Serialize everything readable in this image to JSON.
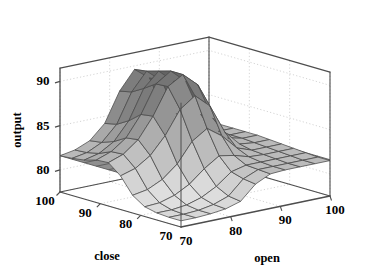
{
  "figure": {
    "type": "surface-plot-3d",
    "background_color": "#ffffff",
    "line_color": "#4d4d4d",
    "grid_color": "#c9c9c9"
  },
  "axes": {
    "x": {
      "name": "open",
      "title": "open",
      "ticks": [
        "70",
        "80",
        "90",
        "100"
      ],
      "tick_values": [
        70,
        80,
        90,
        100
      ],
      "range": [
        70,
        100
      ]
    },
    "y": {
      "name": "close",
      "title": "close",
      "ticks": [
        "100",
        "90",
        "80",
        "70"
      ],
      "tick_values": [
        100,
        90,
        80,
        70
      ],
      "range": [
        70,
        100
      ]
    },
    "z": {
      "name": "output",
      "title": "output",
      "ticks": [
        "80",
        "85",
        "90"
      ],
      "tick_values": [
        80,
        85,
        90
      ],
      "range": [
        77.5,
        91.5
      ]
    }
  },
  "chart_data": {
    "type": "surface",
    "title": "",
    "xlabel": "open",
    "ylabel": "close",
    "zlabel": "output",
    "xlim": [
      70,
      100
    ],
    "ylim": [
      70,
      100
    ],
    "zlim": [
      77.5,
      91.5
    ],
    "grid": true,
    "legend": "none",
    "colormap": "gray",
    "x": [
      70,
      73,
      76,
      79,
      82,
      85,
      88,
      91,
      94,
      97,
      100
    ],
    "y": [
      70,
      73,
      76,
      79,
      82,
      85,
      88,
      91,
      94,
      97,
      100
    ],
    "z_note": "rows correspond to y (close) from 70 to 100, columns to x (open) from 70 to 100",
    "z": [
      [
        78.2,
        78.2,
        78.3,
        78.5,
        79.0,
        80.6,
        81.4,
        81.5,
        81.5,
        81.5,
        81.5
      ],
      [
        78.2,
        78.2,
        78.3,
        78.6,
        79.2,
        80.8,
        81.5,
        81.5,
        81.5,
        81.5,
        81.5
      ],
      [
        78.3,
        78.3,
        78.5,
        79.0,
        79.9,
        81.2,
        81.6,
        81.6,
        81.6,
        81.6,
        81.6
      ],
      [
        78.6,
        78.7,
        79.2,
        80.1,
        81.5,
        82.6,
        82.3,
        81.8,
        81.7,
        81.7,
        81.7
      ],
      [
        79.5,
        79.8,
        80.6,
        82.0,
        84.2,
        85.3,
        84.1,
        82.4,
        81.8,
        81.8,
        81.8
      ],
      [
        81.3,
        81.8,
        82.9,
        84.8,
        87.4,
        88.6,
        87.1,
        83.8,
        82.1,
        81.9,
        81.9
      ],
      [
        82.4,
        83.0,
        84.3,
        86.6,
        89.6,
        90.6,
        89.1,
        85.0,
        82.4,
        82.0,
        82.0
      ],
      [
        82.3,
        82.9,
        84.1,
        86.4,
        89.5,
        90.6,
        89.1,
        85.0,
        82.4,
        82.0,
        82.0
      ],
      [
        81.9,
        82.3,
        83.3,
        85.3,
        88.6,
        90.2,
        88.7,
        84.6,
        82.3,
        82.0,
        82.0
      ],
      [
        81.7,
        82.0,
        82.8,
        84.5,
        87.8,
        89.8,
        88.4,
        84.3,
        82.2,
        82.0,
        82.0
      ],
      [
        81.6,
        81.9,
        82.6,
        84.2,
        87.5,
        89.6,
        88.3,
        84.2,
        82.2,
        82.0,
        82.0
      ]
    ],
    "reference_plane": {
      "present": true,
      "level": 81.6,
      "description": "flat mesh plane spanning the full domain near output 81.6"
    }
  },
  "projection": {
    "origin_x": 181,
    "origin_y": 227,
    "left_vertex_x": 60,
    "left_vertex_y": 192,
    "right_vertex_x": 330,
    "right_vertex_y": 196,
    "top_left_y": 55,
    "z_pixel_per_unit": 8.85
  }
}
